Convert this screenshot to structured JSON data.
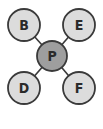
{
  "diagram": {
    "center": {
      "label": "P",
      "x": 52,
      "y": 56,
      "r": 15,
      "fill": "#9e9e9e"
    },
    "nodes": [
      {
        "label": "B",
        "x": 24,
        "y": 25,
        "r": 16,
        "fill": "#dcdcdc"
      },
      {
        "label": "E",
        "x": 79,
        "y": 25,
        "r": 16,
        "fill": "#dcdcdc"
      },
      {
        "label": "D",
        "x": 24,
        "y": 88,
        "r": 16,
        "fill": "#dcdcdc"
      },
      {
        "label": "F",
        "x": 79,
        "y": 88,
        "r": 16,
        "fill": "#dcdcdc"
      }
    ],
    "stroke": "#3a3a3a"
  }
}
